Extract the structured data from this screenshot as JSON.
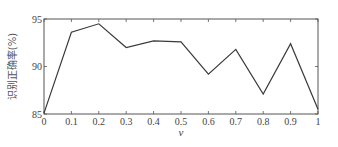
{
  "chart_data": {
    "type": "line",
    "title": "",
    "xlabel": "v",
    "ylabel": "识别正确率(%)",
    "x": [
      0,
      0.1,
      0.2,
      0.3,
      0.4,
      0.5,
      0.6,
      0.7,
      0.8,
      0.9,
      1.0
    ],
    "series": [
      {
        "name": "识别正确率",
        "values": [
          85.1,
          93.6,
          94.5,
          92.0,
          92.7,
          92.6,
          89.2,
          91.8,
          87.1,
          92.4,
          85.5
        ]
      }
    ],
    "xlim": [
      0,
      1
    ],
    "ylim": [
      85,
      95
    ],
    "xticks": [
      0,
      0.1,
      0.2,
      0.3,
      0.4,
      0.5,
      0.6,
      0.7,
      0.8,
      0.9,
      1
    ],
    "xtick_labels": [
      "0",
      "0.1",
      "0.2",
      "0.3",
      "0.4",
      "0.5",
      "0.6",
      "0.7",
      "0.8",
      "0.9",
      "1"
    ],
    "yticks": [
      85,
      90,
      95
    ],
    "ytick_labels": [
      "85",
      "90",
      "95"
    ],
    "grid": false,
    "legend": null,
    "colors": {
      "line": "#3a3a3a",
      "axes": "#555555",
      "background": "#ffffff"
    }
  }
}
